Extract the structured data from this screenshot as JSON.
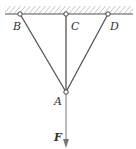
{
  "diagram": {
    "type": "three-bar truss hung from ceiling",
    "points": {
      "B": {
        "label": "B",
        "x": 20,
        "y": 14
      },
      "C": {
        "label": "C",
        "x": 66,
        "y": 14
      },
      "D": {
        "label": "D",
        "x": 108,
        "y": 14
      },
      "A": {
        "label": "A",
        "x": 66,
        "y": 92
      }
    },
    "force": {
      "label": "F",
      "direction": "down"
    },
    "colors": {
      "line": "#555555",
      "hatch": "#777777"
    }
  }
}
